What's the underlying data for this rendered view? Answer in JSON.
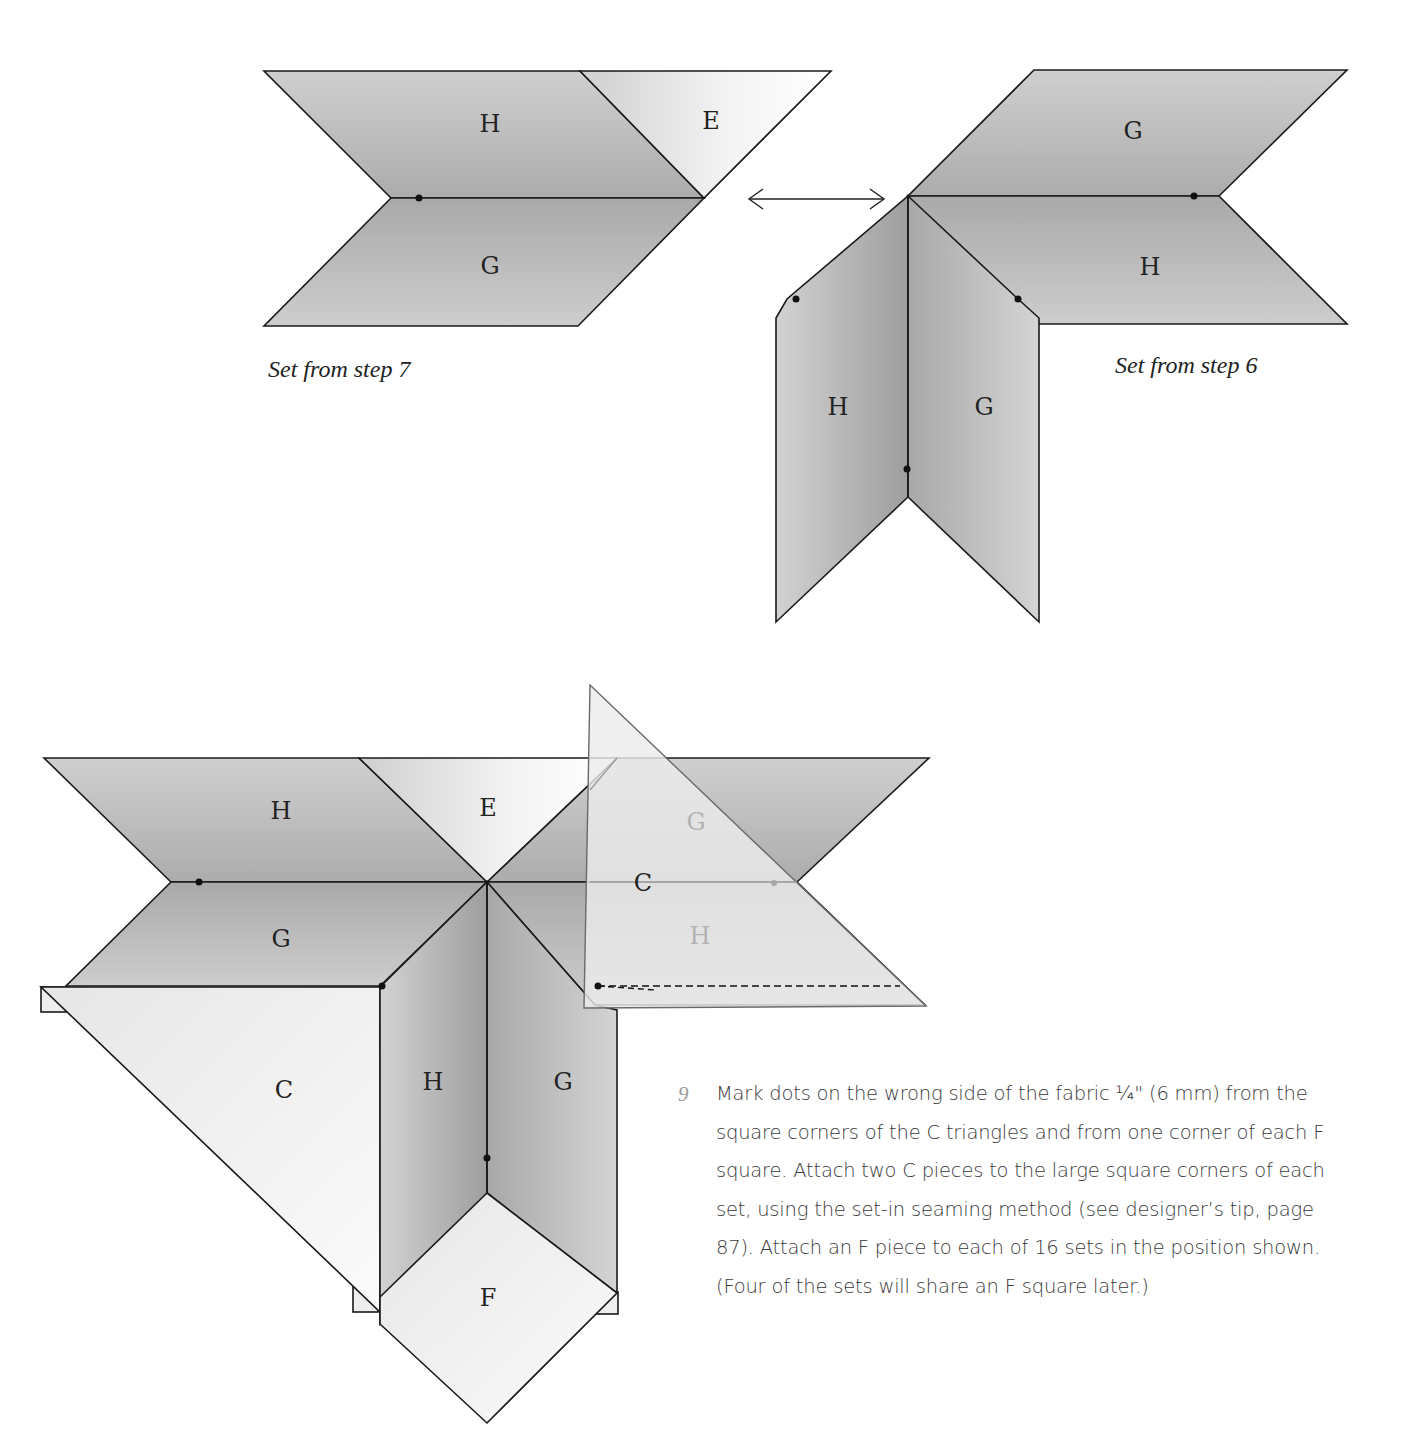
{
  "figure_top_left": {
    "caption": "Set from step 7",
    "pieces": {
      "top_left": "H",
      "top_right": "E",
      "bottom": "G"
    }
  },
  "swap_arrow": {
    "icon": "double-headed-arrow-icon"
  },
  "figure_top_right": {
    "caption": "Set from step 6",
    "pieces": {
      "top": "G",
      "middle": "H",
      "left_vertical": "H",
      "right_vertical": "G"
    }
  },
  "figure_bottom": {
    "pieces": {
      "top_left": "H",
      "top_center": "E",
      "mid_left": "G",
      "right_faint_top": "G",
      "right_triangle": "C",
      "right_faint_bottom": "H",
      "left_triangle": "C",
      "vertical_left": "H",
      "vertical_right": "G",
      "bottom_square": "F"
    }
  },
  "instructions": {
    "step_number": "9",
    "text": "Mark dots on the wrong side of the fabric ¼\" (6 mm) from the square corners of the C triangles and from one corner of each F square. Attach two C pieces to the large square corners of each set, using the set-in seaming method (see designer’s tip, page 87). Attach an F piece to each of 16 sets in the position shown. (Four of the sets will share an F square later.)"
  },
  "colors": {
    "piece_gray": "#b9b9b9",
    "piece_light": "#f2f2f2",
    "outline": "#1a1a1a",
    "step_number": "#9a9a9a"
  }
}
